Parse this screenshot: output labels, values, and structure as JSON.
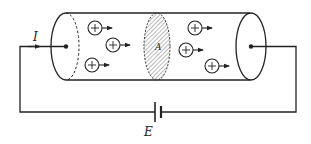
{
  "diagram": {
    "labels": {
      "current": "I",
      "cross_section": "A",
      "emf": "E"
    },
    "charge_symbol": "+",
    "charges": [
      {
        "x": 95,
        "y": 28
      },
      {
        "x": 113,
        "y": 45
      },
      {
        "x": 92,
        "y": 65
      },
      {
        "x": 195,
        "y": 28
      },
      {
        "x": 186,
        "y": 50
      },
      {
        "x": 212,
        "y": 66
      }
    ],
    "colors": {
      "stroke": "#222222",
      "background": "#ffffff",
      "hatch": "#555555"
    }
  }
}
